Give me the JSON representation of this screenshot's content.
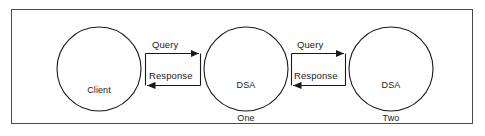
{
  "diagram": {
    "frame": {
      "border_color": "#4a4a4a",
      "background_color": "#ffffff"
    },
    "stroke_color": "#1a1a1a",
    "text_color": "#1a1a1a",
    "nodes": [
      {
        "id": "client",
        "label": "Client",
        "label_line1": "Client",
        "label_line2": "",
        "cx": 99,
        "cy": 69,
        "r": 42
      },
      {
        "id": "dsa-one",
        "label": "DSA One",
        "label_line1": "DSA",
        "label_line2": "One",
        "cx": 246,
        "cy": 69,
        "r": 42
      },
      {
        "id": "dsa-two",
        "label": "DSA Two",
        "label_line1": "DSA",
        "label_line2": "Two",
        "cx": 391,
        "cy": 69,
        "r": 42
      }
    ],
    "edges": [
      {
        "id": "query-left",
        "label": "Query",
        "from": "client",
        "to": "dsa-one",
        "direction": "right"
      },
      {
        "id": "response-left",
        "label": "Response",
        "from": "dsa-one",
        "to": "client",
        "direction": "left"
      },
      {
        "id": "query-right",
        "label": "Query",
        "from": "dsa-one",
        "to": "dsa-two",
        "direction": "right"
      },
      {
        "id": "response-right",
        "label": "Response",
        "from": "dsa-two",
        "to": "dsa-one",
        "direction": "left"
      }
    ]
  }
}
